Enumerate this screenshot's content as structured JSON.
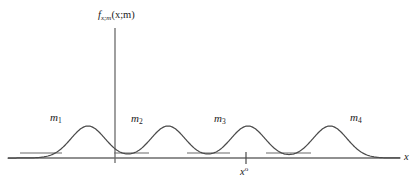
{
  "figure": {
    "background_color": "#ffffff",
    "line_color": "#5a5a5a",
    "curve_color": "#4a4a4a",
    "text_color": "#1a1a1a",
    "width": 418,
    "height": 189
  },
  "axes": {
    "y_axis_label_main": "f",
    "y_axis_label_sub": "x;m",
    "y_axis_label_args": "(x;m)",
    "x_axis_label": "x",
    "x_tick_label_base": "x",
    "x_tick_label_sup": "o",
    "y_axis_x_position": 115,
    "x_axis_y_position": 158,
    "x_axis_start": 8,
    "x_axis_end": 400,
    "y_axis_top": 28,
    "y_axis_bottom": 163,
    "tick_x_position": 246
  },
  "modes": [
    {
      "label": "m",
      "subscript": "1",
      "label_x": 50,
      "label_y": 112,
      "peak_x": 88,
      "baseline_x1": 20,
      "baseline_x2": 62
    },
    {
      "label": "m",
      "subscript": "2",
      "label_x": 131,
      "label_y": 113,
      "peak_x": 168,
      "baseline_x1": 114,
      "baseline_x2": 149
    },
    {
      "label": "m",
      "subscript": "3",
      "label_x": 214,
      "label_y": 113,
      "peak_x": 248,
      "baseline_x1": 187,
      "baseline_x2": 230
    },
    {
      "label": "m",
      "subscript": "4",
      "label_x": 350,
      "label_y": 112,
      "peak_x": 330,
      "baseline_x1": 266,
      "baseline_x2": 311
    }
  ],
  "chart_data": {
    "type": "line",
    "title": "",
    "xlabel": "x",
    "ylabel": "f_{x;m}(x;m)",
    "grid": false,
    "legend": "none",
    "series": [
      {
        "name": "f_{x;m}(x;m)",
        "kind": "mixture-of-gaussians",
        "peaks_x": [
          88,
          168,
          248,
          330
        ],
        "peak_height": 32,
        "peak_sigma": 17,
        "baseline_y": 158
      }
    ],
    "annotations": [
      {
        "text": "m1",
        "x": 50,
        "y": 112
      },
      {
        "text": "m2",
        "x": 131,
        "y": 113
      },
      {
        "text": "m3",
        "x": 214,
        "y": 113
      },
      {
        "text": "m4",
        "x": 350,
        "y": 112
      },
      {
        "text": "x-naught tick",
        "x": 246,
        "y": 158
      }
    ],
    "mode_indicator_segments": [
      {
        "x1": 20,
        "x2": 62,
        "y": 153
      },
      {
        "x1": 114,
        "x2": 149,
        "y": 153
      },
      {
        "x1": 187,
        "x2": 230,
        "y": 153
      },
      {
        "x1": 266,
        "x2": 311,
        "y": 153
      }
    ],
    "xlim": [
      0,
      418
    ],
    "ylim": [
      0,
      40
    ]
  }
}
